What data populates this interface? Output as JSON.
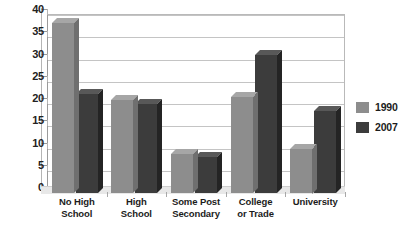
{
  "chart_data": {
    "type": "bar",
    "title": "",
    "subtitle": "",
    "xlabel": "",
    "ylabel": "",
    "ylim": [
      0,
      40
    ],
    "yticks": [
      0,
      5,
      10,
      15,
      20,
      25,
      30,
      35,
      40
    ],
    "ytick_labels": [
      "0",
      "5",
      "10",
      "15",
      "20",
      "25",
      "30",
      "35",
      "40"
    ],
    "grid": true,
    "legend_position": "right",
    "style": "3d-bar",
    "categories": [
      "No High School",
      "High School",
      "Some Post Secondary",
      "College or Trade",
      "University"
    ],
    "category_lines": [
      [
        "No High",
        "School"
      ],
      [
        "High",
        "School"
      ],
      [
        "Some Post",
        "Secondary"
      ],
      [
        "College",
        "or Trade"
      ],
      [
        "University"
      ]
    ],
    "series": [
      {
        "name": "1990",
        "color": "#8d8d8d",
        "values": [
          38.3,
          21.0,
          8.7,
          21.5,
          10.0
        ]
      },
      {
        "name": "2007",
        "color": "#3c3c3c",
        "values": [
          22.2,
          20.0,
          8.2,
          31.0,
          18.5
        ]
      }
    ]
  },
  "legend": {
    "items": [
      {
        "label": "1990",
        "color": "#8d8d8d"
      },
      {
        "label": "2007",
        "color": "#3c3c3c"
      }
    ]
  }
}
